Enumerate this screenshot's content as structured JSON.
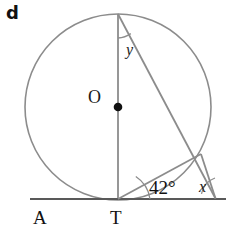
{
  "figure": {
    "part_label": "d",
    "background_color": "#ffffff",
    "stroke_color": "#8c8c8c",
    "line_color": "#595959",
    "text_color": "#1a1a1a",
    "width": 227,
    "height": 233
  },
  "labels": {
    "center": "O",
    "tangent_left_point": "A",
    "tangent_point": "T",
    "angle_y": "y",
    "angle_x": "x",
    "angle_known": "42°"
  },
  "geometry": {
    "circle": {
      "cx": 118,
      "cy": 107,
      "r": 93
    },
    "center_dot": {
      "cx": 118,
      "cy": 107,
      "r": 4
    },
    "center_ring": {
      "cx": 96,
      "cy": 96,
      "r": 8
    },
    "diameter": {
      "x1": 118,
      "y1": 14,
      "x2": 118,
      "y2": 199
    },
    "tangent_line": {
      "x1": 30,
      "y1": 199,
      "x2": 225,
      "y2": 199
    },
    "chord_top_to_p": {
      "x1": 118,
      "y1": 14,
      "x2": 200,
      "y2": 155
    },
    "secant_extension": {
      "x1": 200,
      "y1": 155,
      "x2": 215,
      "y2": 198
    },
    "chord_t_to_p": {
      "x1": 118,
      "y1": 199,
      "x2": 200,
      "y2": 155
    },
    "point_p": {
      "cx": 200,
      "cy": 155
    },
    "external_point": {
      "cx": 215,
      "cy": 198
    },
    "arc_y": "M 118 36 A 22 22 0 0 0 130.6 32.2",
    "arc_42": "M 148 199 A 30 30 0 0 0 134.5 177.6",
    "arc_x": "M 215 179 A 19 19 0 0 0 202 193.5"
  }
}
